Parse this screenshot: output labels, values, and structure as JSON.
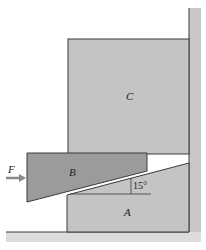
{
  "diagram": {
    "type": "wedge-mechanics",
    "labels": {
      "block_c": "C",
      "wedge_b": "B",
      "wedge_a": "A",
      "force": "F",
      "angle": "15°"
    },
    "colors": {
      "block_c": "#c4c4c4",
      "wedge_a": "#c4c4c4",
      "wedge_b": "#9b9b9b",
      "wall": "#c8c8c8",
      "outline": "#3a3a3a",
      "arrow": "#8a8a8a"
    }
  }
}
